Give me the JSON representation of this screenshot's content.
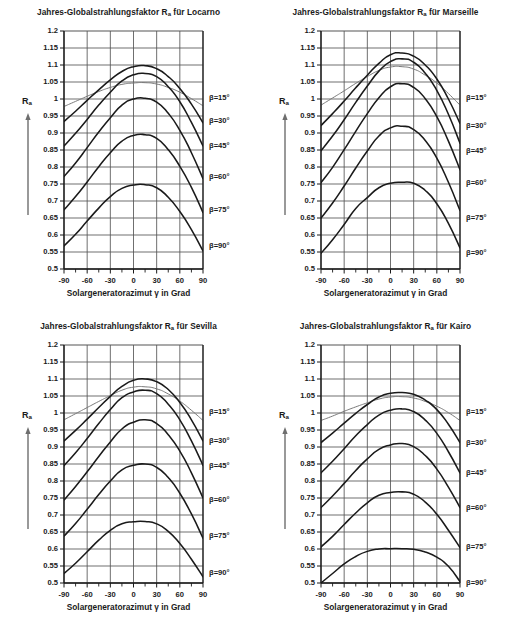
{
  "figure": {
    "axis_title_x": "Solargeneratorazimut γ in Grad",
    "y_axis_name": "R",
    "y_axis_name_sub": "a",
    "title_prefix": "Jahres-Globalstrahlungsfaktor R",
    "title_sub": "a",
    "title_middle": " für ",
    "colors": {
      "curve": "#1a1a1a",
      "curve_flat": "#7a7a7a",
      "grid": "#555555",
      "axis": "#1a1a1a",
      "background": "#ffffff",
      "text": "#1a1a1a"
    },
    "y_ticks": [
      "1.2",
      "1.15",
      "1.1",
      "1.05",
      "1",
      "0.95",
      "0.9",
      "0.85",
      "0.8",
      "0.75",
      "0.7",
      "0.65",
      "0.6",
      "0.55",
      "0.5"
    ],
    "x_ticks": [
      "-90",
      "-60",
      "-30",
      "0",
      "30",
      "60",
      "90"
    ],
    "minor_x_ticks": [
      "-75",
      "-45",
      "-15",
      "15",
      "45",
      "75"
    ],
    "series_labels": [
      "β=15°",
      "β=30°",
      "β=45°",
      "β=60°",
      "β=75°",
      "β=90°"
    ]
  },
  "chart_data": [
    {
      "type": "line",
      "title": "Jahres-Globalstrahlungsfaktor Ra für Locarno",
      "location": "Locarno",
      "xlabel": "Solargeneratorazimut γ in Grad",
      "ylabel": "Ra",
      "xlim": [
        -90,
        90
      ],
      "ylim": [
        0.5,
        1.2
      ],
      "ytick_step": 0.05,
      "xtick_step": 30,
      "grid": true,
      "legend_position": "right-outside",
      "x": [
        -90,
        -75,
        -60,
        -45,
        -30,
        -15,
        0,
        15,
        30,
        45,
        60,
        75,
        90
      ],
      "series": [
        {
          "name": "β=15°",
          "peak": 1.048,
          "peak_x": 5,
          "edge": 0.978,
          "values": [
            0.978,
            0.993,
            1.008,
            1.022,
            1.034,
            1.043,
            1.047,
            1.048,
            1.044,
            1.034,
            1.02,
            1.001,
            0.98
          ]
        },
        {
          "name": "β=30°",
          "peak": 1.098,
          "peak_x": 5,
          "edge": 0.934,
          "values": [
            0.934,
            0.964,
            0.996,
            1.027,
            1.056,
            1.081,
            1.095,
            1.098,
            1.089,
            1.066,
            1.031,
            0.985,
            0.93
          ]
        },
        {
          "name": "β=45°",
          "peak": 1.075,
          "peak_x": 8,
          "edge": 0.862,
          "values": [
            0.862,
            0.899,
            0.94,
            0.982,
            1.02,
            1.053,
            1.071,
            1.075,
            1.066,
            1.036,
            0.992,
            0.931,
            0.862
          ]
        },
        {
          "name": "β=60°",
          "peak": 1.002,
          "peak_x": 8,
          "edge": 0.772,
          "values": [
            0.772,
            0.812,
            0.857,
            0.903,
            0.945,
            0.982,
            1.0,
            1.002,
            0.991,
            0.958,
            0.908,
            0.842,
            0.766
          ]
        },
        {
          "name": "β=75°",
          "peak": 0.895,
          "peak_x": 8,
          "edge": 0.674,
          "values": [
            0.674,
            0.713,
            0.756,
            0.801,
            0.842,
            0.876,
            0.893,
            0.895,
            0.884,
            0.851,
            0.802,
            0.74,
            0.666
          ]
        },
        {
          "name": "β=90°",
          "peak": 0.748,
          "peak_x": 8,
          "edge": 0.568,
          "values": [
            0.568,
            0.602,
            0.641,
            0.679,
            0.713,
            0.737,
            0.747,
            0.748,
            0.739,
            0.711,
            0.669,
            0.616,
            0.553
          ]
        }
      ]
    },
    {
      "type": "line",
      "title": "Jahres-Globalstrahlungsfaktor Ra für Marseille",
      "location": "Marseille",
      "xlabel": "Solargeneratorazimut γ in Grad",
      "ylabel": "Ra",
      "xlim": [
        -90,
        90
      ],
      "ylim": [
        0.5,
        1.2
      ],
      "ytick_step": 0.05,
      "xtick_step": 30,
      "grid": true,
      "legend_position": "right-outside",
      "x": [
        -90,
        -75,
        -60,
        -45,
        -30,
        -15,
        0,
        15,
        30,
        45,
        60,
        75,
        90
      ],
      "series": [
        {
          "name": "β=15°",
          "peak": 1.095,
          "peak_x": 3,
          "edge": 0.982,
          "values": [
            0.982,
            1.003,
            1.024,
            1.046,
            1.066,
            1.084,
            1.094,
            1.095,
            1.088,
            1.07,
            1.047,
            1.016,
            0.982
          ]
        },
        {
          "name": "β=30°",
          "peak": 1.135,
          "peak_x": 3,
          "edge": 0.922,
          "values": [
            0.922,
            0.957,
            0.994,
            1.033,
            1.07,
            1.105,
            1.13,
            1.135,
            1.126,
            1.1,
            1.059,
            1.0,
            0.928
          ]
        },
        {
          "name": "β=45°",
          "peak": 1.118,
          "peak_x": 5,
          "edge": 0.848,
          "values": [
            0.848,
            0.891,
            0.939,
            0.99,
            1.038,
            1.082,
            1.11,
            1.118,
            1.108,
            1.076,
            1.025,
            0.955,
            0.87
          ]
        },
        {
          "name": "β=60°",
          "peak": 1.045,
          "peak_x": 5,
          "edge": 0.754,
          "values": [
            0.754,
            0.799,
            0.851,
            0.905,
            0.957,
            1.004,
            1.036,
            1.045,
            1.034,
            1.001,
            0.948,
            0.876,
            0.792
          ]
        },
        {
          "name": "β=75°",
          "peak": 0.92,
          "peak_x": 5,
          "edge": 0.65,
          "values": [
            0.65,
            0.694,
            0.744,
            0.797,
            0.847,
            0.891,
            0.915,
            0.92,
            0.91,
            0.878,
            0.826,
            0.755,
            0.672
          ]
        },
        {
          "name": "β=90°",
          "peak": 0.755,
          "peak_x": 5,
          "edge": 0.546,
          "values": [
            0.546,
            0.586,
            0.631,
            0.678,
            0.71,
            0.739,
            0.752,
            0.755,
            0.752,
            0.731,
            0.692,
            0.634,
            0.562
          ]
        }
      ]
    },
    {
      "type": "line",
      "title": "Jahres-Globalstrahlungsfaktor Ra für Sevilla",
      "location": "Sevilla",
      "xlabel": "Solargeneratorazimut γ in Grad",
      "ylabel": "Ra",
      "xlim": [
        -90,
        90
      ],
      "ylim": [
        0.5,
        1.2
      ],
      "ytick_step": 0.05,
      "xtick_step": 30,
      "grid": true,
      "legend_position": "right-outside",
      "x": [
        -90,
        -75,
        -60,
        -45,
        -30,
        -15,
        0,
        15,
        30,
        45,
        60,
        75,
        90
      ],
      "series": [
        {
          "name": "β=15°",
          "peak": 1.077,
          "peak_x": 3,
          "edge": 0.98,
          "values": [
            0.98,
            0.998,
            1.016,
            1.034,
            1.051,
            1.067,
            1.076,
            1.077,
            1.071,
            1.056,
            1.035,
            1.008,
            0.978
          ]
        },
        {
          "name": "β=30°",
          "peak": 1.1,
          "peak_x": 3,
          "edge": 0.918,
          "values": [
            0.918,
            0.949,
            0.982,
            1.016,
            1.049,
            1.078,
            1.096,
            1.1,
            1.092,
            1.069,
            1.031,
            0.98,
            0.918
          ]
        },
        {
          "name": "β=45°",
          "peak": 1.067,
          "peak_x": 5,
          "edge": 0.845,
          "values": [
            0.845,
            0.883,
            0.925,
            0.969,
            1.01,
            1.045,
            1.062,
            1.067,
            1.057,
            1.026,
            0.98,
            0.918,
            0.846
          ]
        },
        {
          "name": "β=60°",
          "peak": 0.98,
          "peak_x": 5,
          "edge": 0.744,
          "values": [
            0.744,
            0.784,
            0.827,
            0.872,
            0.915,
            0.953,
            0.973,
            0.98,
            0.969,
            0.936,
            0.888,
            0.824,
            0.75
          ]
        },
        {
          "name": "β=75°",
          "peak": 0.85,
          "peak_x": 5,
          "edge": 0.638,
          "values": [
            0.638,
            0.675,
            0.717,
            0.76,
            0.8,
            0.833,
            0.846,
            0.85,
            0.84,
            0.81,
            0.764,
            0.703,
            0.632
          ]
        },
        {
          "name": "β=90°",
          "peak": 0.681,
          "peak_x": 8,
          "edge": 0.528,
          "values": [
            0.528,
            0.558,
            0.592,
            0.626,
            0.655,
            0.674,
            0.68,
            0.681,
            0.674,
            0.652,
            0.616,
            0.57,
            0.518
          ]
        }
      ]
    },
    {
      "type": "line",
      "title": "Jahres-Globalstrahlungsfaktor Ra für Kairo",
      "location": "Kairo",
      "xlabel": "Solargeneratorazimut γ in Grad",
      "ylabel": "Ra",
      "xlim": [
        -90,
        90
      ],
      "ylim": [
        0.5,
        1.2
      ],
      "ytick_step": 0.05,
      "xtick_step": 30,
      "grid": true,
      "legend_position": "right-outside",
      "x": [
        -90,
        -75,
        -60,
        -45,
        -30,
        -15,
        0,
        15,
        30,
        45,
        60,
        75,
        90
      ],
      "series": [
        {
          "name": "β=15°",
          "peak": 1.048,
          "peak_x": 3,
          "edge": 0.978,
          "values": [
            0.978,
            0.991,
            1.005,
            1.018,
            1.03,
            1.041,
            1.047,
            1.048,
            1.044,
            1.034,
            1.02,
            1.001,
            0.978
          ]
        },
        {
          "name": "β=30°",
          "peak": 1.06,
          "peak_x": 3,
          "edge": 0.913,
          "values": [
            0.913,
            0.941,
            0.97,
            0.999,
            1.025,
            1.047,
            1.058,
            1.06,
            1.055,
            1.038,
            1.01,
            0.967,
            0.913
          ]
        },
        {
          "name": "β=45°",
          "peak": 1.012,
          "peak_x": 5,
          "edge": 0.824,
          "values": [
            0.824,
            0.858,
            0.895,
            0.933,
            0.966,
            0.994,
            1.008,
            1.012,
            1.004,
            0.979,
            0.94,
            0.886,
            0.824
          ]
        },
        {
          "name": "β=60°",
          "peak": 0.91,
          "peak_x": 5,
          "edge": 0.722,
          "values": [
            0.722,
            0.756,
            0.793,
            0.831,
            0.865,
            0.893,
            0.906,
            0.91,
            0.901,
            0.875,
            0.835,
            0.782,
            0.722
          ]
        },
        {
          "name": "β=75°",
          "peak": 0.768,
          "peak_x": 5,
          "edge": 0.606,
          "values": [
            0.606,
            0.637,
            0.672,
            0.706,
            0.736,
            0.758,
            0.766,
            0.768,
            0.761,
            0.738,
            0.702,
            0.655,
            0.604
          ]
        },
        {
          "name": "β=90°",
          "peak": 0.601,
          "peak_x": 0,
          "edge": 0.5,
          "values": [
            0.5,
            0.528,
            0.556,
            0.578,
            0.593,
            0.6,
            0.601,
            0.601,
            0.599,
            0.591,
            0.576,
            0.549,
            0.504
          ]
        }
      ]
    }
  ]
}
